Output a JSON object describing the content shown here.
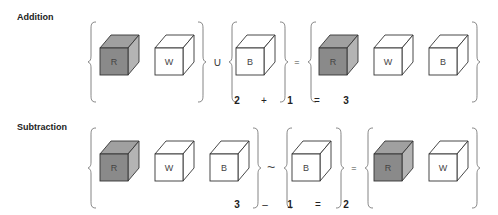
{
  "sections": [
    {
      "title": "Addition",
      "groups": [
        {
          "cubes": [
            {
              "letter": "R",
              "shaded": true
            },
            {
              "letter": "W",
              "shaded": false
            }
          ]
        },
        {
          "cubes": [
            {
              "letter": "B",
              "shaded": false
            }
          ]
        },
        {
          "cubes": [
            {
              "letter": "R",
              "shaded": true
            },
            {
              "letter": "W",
              "shaded": false
            },
            {
              "letter": "B",
              "shaded": false
            }
          ]
        }
      ],
      "set_operators": [
        "∪",
        "="
      ],
      "equation": [
        "2",
        "+",
        "1",
        "=",
        "3"
      ]
    },
    {
      "title": "Subtraction",
      "groups": [
        {
          "cubes": [
            {
              "letter": "R",
              "shaded": true
            },
            {
              "letter": "W",
              "shaded": false
            },
            {
              "letter": "B",
              "shaded": false
            }
          ]
        },
        {
          "cubes": [
            {
              "letter": "B",
              "shaded": false
            }
          ]
        },
        {
          "cubes": [
            {
              "letter": "R",
              "shaded": true
            },
            {
              "letter": "W",
              "shaded": false
            }
          ]
        }
      ],
      "set_operators": [
        "~",
        "="
      ],
      "equation": [
        "3",
        "–",
        "1",
        "=",
        "2"
      ]
    }
  ],
  "colors": {
    "shaded_front": "#8a8a8a",
    "shaded_top": "#a0a0a0",
    "shaded_side": "#b4b4b4",
    "outline": "#333333"
  }
}
